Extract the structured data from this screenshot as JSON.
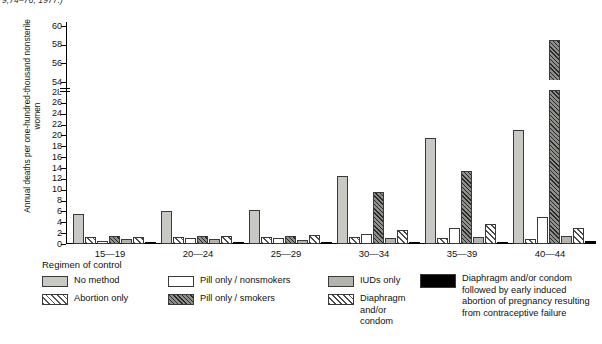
{
  "source_note": "9;74–76, 1977.)",
  "axis": {
    "ylabel": "Annual deaths per one-hundred-thousand nonsterile women",
    "ytick_labels": [
      "0",
      "2",
      "4",
      "6",
      "8",
      "10",
      "12",
      "14",
      "16",
      "18",
      "20",
      "22",
      "24",
      "26",
      "28",
      "54",
      "56",
      "58",
      "60"
    ],
    "ymin": 0,
    "ymax_lower": 28,
    "ymin_upper": 54,
    "ymax_upper": 60,
    "has_break": true
  },
  "legend": {
    "title": "Regimen of control",
    "items": [
      {
        "key": "no-method",
        "label": "No method",
        "color": "#c9c9c4"
      },
      {
        "key": "abortion",
        "label": "Abortion only",
        "color": "#ffffff"
      },
      {
        "key": "pill-non",
        "label": "Pill only / nonsmokers",
        "color": "#ffffff"
      },
      {
        "key": "pill-smoke",
        "label": "Pill only / smokers",
        "color": "#8f8f8a"
      },
      {
        "key": "iud",
        "label": "IUDs only",
        "color": "#b4b4ae"
      },
      {
        "key": "diaphragm",
        "label": "Diaphragm\nand/or\ncondom",
        "color": "#ffffff"
      },
      {
        "key": "black",
        "label": "Diaphragm and/or condom\nfollowed by early induced\nabortion of pregnancy resulting\nfrom contraceptive failure",
        "color": "#000000"
      }
    ]
  },
  "chart_data": {
    "type": "bar",
    "title": "",
    "xlabel": "",
    "ylabel": "Annual deaths per one-hundred-thousand nonsterile women",
    "ylim": [
      0,
      60
    ],
    "y_axis_break": [
      28,
      54
    ],
    "grid": false,
    "legend_position": "bottom",
    "categories": [
      "15—19",
      "20—24",
      "25—29",
      "30—34",
      "35—39",
      "40—44"
    ],
    "series": [
      {
        "name": "No method",
        "values": [
          5.5,
          6.0,
          6.3,
          12.5,
          19.5,
          21.0
        ]
      },
      {
        "name": "Abortion only",
        "values": [
          1.3,
          1.3,
          1.3,
          1.3,
          1.1,
          0.9
        ]
      },
      {
        "name": "Pill only / nonsmokers",
        "values": [
          0.6,
          1.1,
          1.2,
          1.9,
          3.0,
          5.0
        ]
      },
      {
        "name": "Pill only / smokers",
        "values": [
          1.4,
          1.5,
          1.5,
          9.5,
          13.5,
          58.5
        ]
      },
      {
        "name": "IUDs only",
        "values": [
          1.0,
          0.9,
          0.8,
          1.1,
          1.3,
          1.4
        ]
      },
      {
        "name": "Diaphragm and/or condom",
        "values": [
          1.3,
          1.4,
          1.7,
          2.6,
          3.6,
          3.0
        ]
      },
      {
        "name": "Diaphragm and/or condom followed by early induced abortion of pregnancy resulting from contraceptive failure",
        "values": [
          0.15,
          0.25,
          0.3,
          0.3,
          0.4,
          0.5
        ]
      }
    ]
  }
}
